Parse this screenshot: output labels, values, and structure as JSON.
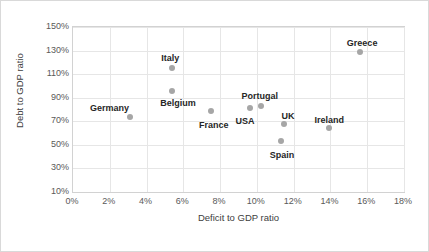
{
  "chart_data": {
    "type": "scatter",
    "title": "",
    "xlabel": "Deficit to GDP ratio",
    "ylabel": "Debt to GDP ratio",
    "xlim": [
      0,
      18
    ],
    "ylim": [
      10,
      150
    ],
    "xticks": [
      "0%",
      "2%",
      "4%",
      "6%",
      "8%",
      "10%",
      "12%",
      "14%",
      "16%",
      "18%"
    ],
    "yticks": [
      "10%",
      "30%",
      "50%",
      "70%",
      "90%",
      "110%",
      "130%",
      "150%"
    ],
    "grid": true,
    "legend": "none",
    "point_color": "#a6a6a6",
    "points": [
      {
        "label": "Germany",
        "x": 3.1,
        "y": 74,
        "label_dx": -40,
        "label_dy": -14
      },
      {
        "label": "Italy",
        "x": 5.4,
        "y": 115,
        "label_dx": -11,
        "label_dy": -15
      },
      {
        "label": "Belgium",
        "x": 5.4,
        "y": 96,
        "label_dx": -12,
        "label_dy": 7
      },
      {
        "label": "France",
        "x": 7.5,
        "y": 79,
        "label_dx": -12,
        "label_dy": 9
      },
      {
        "label": "USA",
        "x": 9.6,
        "y": 81,
        "label_dx": -14,
        "label_dy": 8
      },
      {
        "label": "Portugal",
        "x": 10.2,
        "y": 83,
        "label_dx": -19,
        "label_dy": -15
      },
      {
        "label": "UK",
        "x": 11.5,
        "y": 68,
        "label_dx": -3,
        "label_dy": -13
      },
      {
        "label": "Spain",
        "x": 11.3,
        "y": 53,
        "label_dx": -11,
        "label_dy": 9
      },
      {
        "label": "Ireland",
        "x": 13.9,
        "y": 64,
        "label_dx": -14,
        "label_dy": -13
      },
      {
        "label": "Greece",
        "x": 15.6,
        "y": 129,
        "label_dx": -13,
        "label_dy": -14
      }
    ]
  }
}
